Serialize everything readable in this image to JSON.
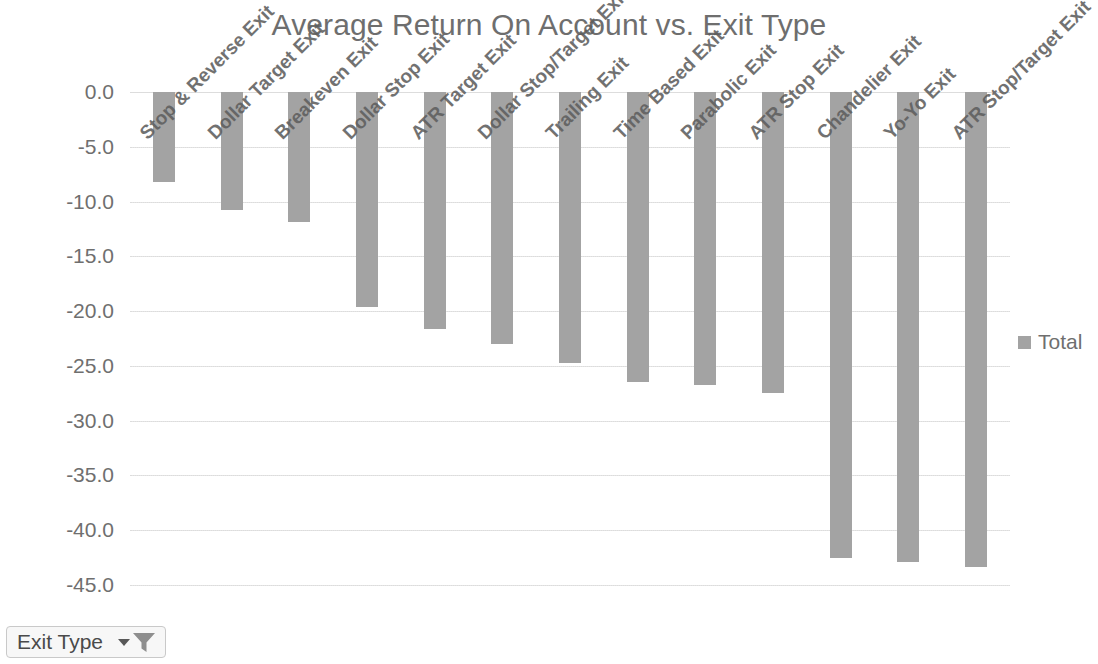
{
  "chart_data": {
    "type": "bar",
    "title": "Average Return On Account vs. Exit Type",
    "xlabel": "",
    "ylabel": "",
    "categories": [
      "Stop & Reverse Exit",
      "Dollar Target Exit",
      "Breakeven Exit",
      "Dollar Stop Exit",
      "ATR Target Exit",
      "Dollar Stop/Target Exit",
      "Trailing Exit",
      "Time Based Exit",
      "Parabolic Exit",
      "ATR Stop Exit",
      "Chandelier Exit",
      "Yo-Yo Exit",
      "ATR Stop/Target Exit"
    ],
    "series": [
      {
        "name": "Total",
        "values": [
          -8.2,
          -10.8,
          -11.9,
          -19.6,
          -21.6,
          -23.0,
          -24.7,
          -26.5,
          -26.7,
          -27.5,
          -42.5,
          -42.9,
          -43.4
        ],
        "color": "#a3a3a3"
      }
    ],
    "ylim": [
      -45.0,
      0.0
    ],
    "y_tick_labels": [
      "0.0",
      "-5.0",
      "-10.0",
      "-15.0",
      "-20.0",
      "-25.0",
      "-30.0",
      "-35.0",
      "-40.0",
      "-45.0"
    ],
    "y_tick_values": [
      0.0,
      -5.0,
      -10.0,
      -15.0,
      -20.0,
      -25.0,
      -30.0,
      -35.0,
      -40.0,
      -45.0
    ],
    "grid": true,
    "legend_position": "right",
    "orientation": "vertical"
  },
  "legend": {
    "entries": [
      {
        "label": "Total",
        "color": "#a3a3a3"
      }
    ]
  },
  "filter": {
    "label": "Exit Type",
    "dropdown_icon": "chevron-down-icon",
    "filter_icon": "funnel-icon"
  },
  "colors": {
    "bar": "#a3a3a3",
    "text": "#6f6f6f",
    "grid": "#e4e4e4",
    "background": "#ffffff"
  }
}
